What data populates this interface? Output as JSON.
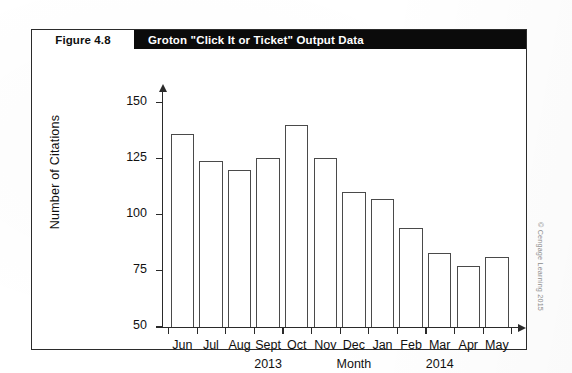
{
  "figure": {
    "label": "Figure 4.8",
    "title": "Groton \"Click It or Ticket\" Output Data"
  },
  "credit": {
    "text": "© Cengage Learning 2015"
  },
  "chart_data": {
    "type": "bar",
    "title": "Groton \"Click It or Ticket\" Output Data",
    "xlabel": "Month",
    "ylabel": "Number of Citations",
    "categories": [
      "Jun",
      "Jul",
      "Aug",
      "Sept",
      "Oct",
      "Nov",
      "Dec",
      "Jan",
      "Feb",
      "Mar",
      "Apr",
      "May"
    ],
    "values": [
      136,
      124,
      120,
      125,
      140,
      125,
      110,
      107,
      94,
      83,
      77,
      81
    ],
    "ylim": [
      50,
      155
    ],
    "yticks": [
      50,
      75,
      100,
      125,
      150
    ],
    "ytick_labels": [
      "50",
      "75",
      "100",
      "125",
      "150"
    ],
    "grid": false,
    "legend": null,
    "group_labels": [
      {
        "text": "2013",
        "center_category": "Sept"
      },
      {
        "text": "Month",
        "center_category": "Dec"
      },
      {
        "text": "2014",
        "center_category": "Mar"
      }
    ],
    "bar_style": {
      "fill": "#ffffff",
      "edge": "#4a4a4a"
    }
  }
}
